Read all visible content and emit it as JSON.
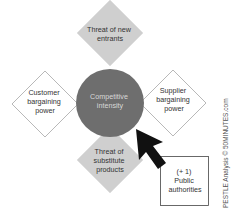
{
  "diagram": {
    "center": {
      "lines": [
        "Competitive",
        "intensity"
      ],
      "fill": "#6e6e6e",
      "text_color": "#d8d8d8"
    },
    "top": {
      "lines": [
        "Threat of new",
        "entrants"
      ],
      "fill": "#cfcfcf"
    },
    "left": {
      "lines": [
        "Customer",
        "bargaining",
        "power"
      ],
      "fill": "#ffffff"
    },
    "right": {
      "lines": [
        "Supplier",
        "bargaining",
        "power"
      ],
      "fill": "#ffffff"
    },
    "bottom": {
      "lines": [
        "Threat of",
        "substitute",
        "products"
      ],
      "fill": "#cfcfcf"
    },
    "extra": {
      "lines": [
        "(+ 1)",
        "Public",
        "authorities"
      ]
    },
    "credit": "PESTLE Analysis  ©  50MINUTES.com",
    "colors": {
      "text": "#333333",
      "stroke": "#9a9a9a",
      "arrow": "#111111"
    }
  }
}
